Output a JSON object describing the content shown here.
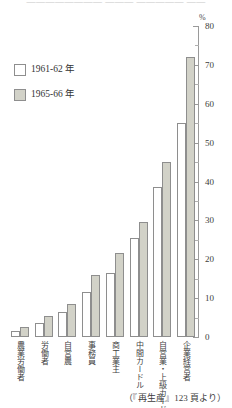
{
  "figure": {
    "top_cropped_text": "————————  ———  —————  ——",
    "source_note": "（『再生産』123 頁より）",
    "unit_label": "%"
  },
  "legend": {
    "position": "top-left",
    "entries": [
      {
        "label": "1961-62 年",
        "color": "#ffffff",
        "swatch": "white-square"
      },
      {
        "label": "1965-66 年",
        "color": "#d2d2c8",
        "swatch": "gray-square"
      }
    ]
  },
  "axis": {
    "y_ticks": [
      "0",
      "10",
      "20",
      "30",
      "40",
      "50",
      "60",
      "70",
      "80"
    ],
    "y_min": 0,
    "y_max": 80
  },
  "chart_data": {
    "type": "bar",
    "title": "",
    "xlabel": "",
    "ylabel": "%",
    "ylim": [
      0,
      80
    ],
    "grid": false,
    "legend_position": "top-left",
    "categories": [
      "農業労働者",
      "労働者",
      "自営農",
      "事務員",
      "商工業主",
      "中間カードル",
      "自営業・上級カードル",
      "企業経営者"
    ],
    "series": [
      {
        "name": "1961-62 年",
        "color": "#ffffff",
        "values": [
          1.5,
          3.5,
          6.5,
          11.5,
          16.5,
          25.5,
          38.5,
          55.0
        ]
      },
      {
        "name": "1965-66 年",
        "color": "#d2d2c8",
        "values": [
          2.5,
          5.5,
          8.5,
          16.0,
          21.5,
          29.5,
          45.0,
          72.0
        ]
      }
    ]
  }
}
